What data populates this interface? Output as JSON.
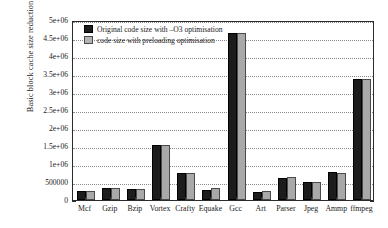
{
  "chart_data": {
    "type": "bar",
    "title": "",
    "xlabel": "",
    "ylabel": "Basic block cache size reduction",
    "ylim": [
      0,
      5000000
    ],
    "grid": true,
    "legend_position": "top-left-inside",
    "categories": [
      "Mcf",
      "Gzip",
      "Bzip",
      "Vortex",
      "Crafty",
      "Equake",
      "Gcc",
      "Art",
      "Parser",
      "Jpeg",
      "Ammp",
      "ffmpeg"
    ],
    "ytick_labels": [
      "0",
      "500000",
      "1e+06",
      "1.5e+06",
      "2e+06",
      "2.5e+06",
      "3e+06",
      "3.5e+06",
      "4e+06",
      "4.5e+06",
      "5e+06"
    ],
    "ytick_values": [
      0,
      500000,
      1000000,
      1500000,
      2000000,
      2500000,
      3000000,
      3500000,
      4000000,
      4500000,
      5000000
    ],
    "series": [
      {
        "name": "Original code size with –O3 optimisation",
        "color": "#1c1c1c",
        "values": [
          245000,
          320000,
          300000,
          1520000,
          750000,
          290000,
          4650000,
          225000,
          620000,
          500000,
          780000,
          3350000
        ]
      },
      {
        "name": "code size with preloading optimisation",
        "color": "#a9a9a9",
        "values": [
          250000,
          330000,
          310000,
          1530000,
          755000,
          320000,
          4650000,
          240000,
          635000,
          505000,
          760000,
          3370000
        ]
      }
    ]
  },
  "legend": {
    "items": [
      {
        "label": "Original code size with –O3 optimisation",
        "swatch": "dark"
      },
      {
        "label": "code size with preloading optimisation",
        "swatch": "light"
      }
    ]
  }
}
